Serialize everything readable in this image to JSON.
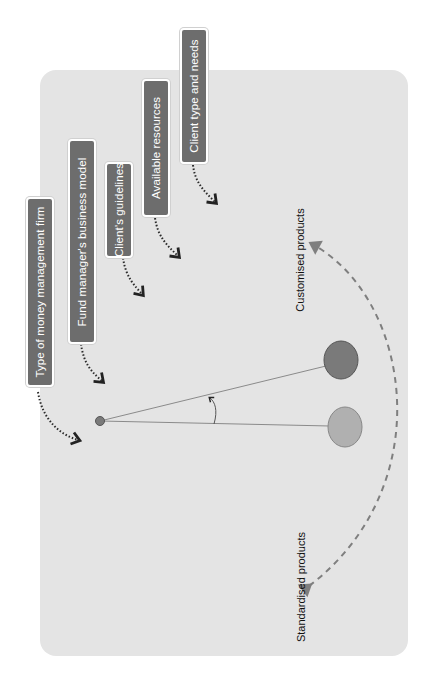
{
  "diagram": {
    "factors": [
      {
        "label": "Type of money management firm"
      },
      {
        "label": "Fund manager's business model"
      },
      {
        "label": "Client's guidelines"
      },
      {
        "label": "Available resources"
      },
      {
        "label": "Client type and needs"
      }
    ],
    "spectrum": {
      "top_label": "Customised products",
      "bottom_label": "Standardised products"
    },
    "colors": {
      "panel": "#e4e4e4",
      "box": "#6d6d6d",
      "box_text": "#ffffff",
      "dark_circle": "#7a7a7a",
      "light_circle": "#b0b0b0",
      "arc": "#7f7f7f"
    }
  }
}
